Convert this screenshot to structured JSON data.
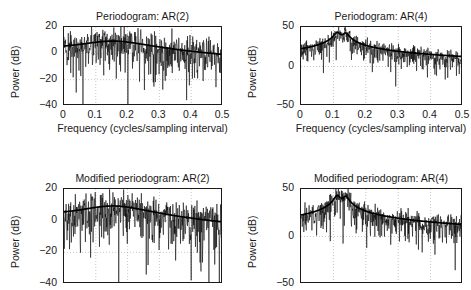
{
  "figure": {
    "background": "#ffffff",
    "ink": "#1a1a1a",
    "grid_color": "#9a9a9a",
    "data_color": "#000000",
    "smooth_color": "#000000"
  },
  "chart_data": [
    {
      "id": "periodogram-ar2",
      "type": "line",
      "title": "Periodogram: AR(2)",
      "xlabel": "Frequency (cycles/sampling interval)",
      "ylabel": "Power (dB)",
      "xlim": [
        0,
        0.5
      ],
      "ylim": [
        -40,
        20
      ],
      "xticks": [
        0,
        0.1,
        0.2,
        0.3,
        0.4,
        0.5
      ],
      "xticklabels": [
        "0",
        "0.1",
        "0.2",
        "0.3",
        "0.4",
        "0.5"
      ],
      "yticks": [
        -40,
        -20,
        0,
        20
      ],
      "yticklabels": [
        "-40",
        "-20",
        "0",
        "20"
      ],
      "grid": true,
      "show_xticklabels": true,
      "show_xlabel": true,
      "noise_db": 9.5,
      "seed": 1207,
      "series": [
        {
          "name": "periodogram estimate",
          "kind": "noisy-spectrum",
          "color": "#000000"
        },
        {
          "name": "true AR(2) spectrum",
          "kind": "smooth-spectrum",
          "color": "#000000",
          "peaks": [
            {
              "f0": 0.155,
              "gain": 9.0,
              "width": 0.105
            }
          ],
          "floor_db": -8.5,
          "base_db": 0.5,
          "tilt_db": -8.5
        }
      ]
    },
    {
      "id": "periodogram-ar4",
      "type": "line",
      "title": "Periodogram: AR(4)",
      "xlabel": "Frequency (cycles/sampling interval)",
      "ylabel": "Power (dB)",
      "xlim": [
        0,
        0.5
      ],
      "ylim": [
        -50,
        50
      ],
      "xticks": [
        0,
        0.1,
        0.2,
        0.3,
        0.4,
        0.5
      ],
      "xticklabels": [
        "0",
        "0.1",
        "0.2",
        "0.3",
        "0.4",
        "0.5"
      ],
      "yticks": [
        -50,
        0,
        50
      ],
      "yticklabels": [
        "-50",
        "0",
        "50"
      ],
      "grid": true,
      "show_xticklabels": true,
      "show_xlabel": true,
      "noise_db": 8.0,
      "noise_floor_db": -7.0,
      "seed": 4411,
      "series": [
        {
          "name": "periodogram estimate",
          "kind": "noisy-spectrum-floor",
          "color": "#000000"
        },
        {
          "name": "true AR(4) spectrum",
          "kind": "smooth-spectrum",
          "color": "#000000",
          "peaks": [
            {
              "f0": 0.112,
              "gain": 43.0,
              "width": 0.0085
            },
            {
              "f0": 0.138,
              "gain": 42.0,
              "width": 0.0085
            }
          ],
          "floor_db": -22.0,
          "base_db": 9.0,
          "tilt_db": -31.0
        }
      ]
    },
    {
      "id": "modified-periodogram-ar2",
      "type": "line",
      "title": "Modified periodogram: AR(2)",
      "xlabel": "Frequency (cycles/sampling interval)",
      "ylabel": "Power (dB)",
      "xlim": [
        0,
        0.5
      ],
      "ylim": [
        -40,
        20
      ],
      "xticks": [
        0,
        0.1,
        0.2,
        0.3,
        0.4,
        0.5
      ],
      "xticklabels": [
        "0",
        "0.1",
        "0.2",
        "0.3",
        "0.4",
        "0.5"
      ],
      "yticks": [
        -40,
        -20,
        0,
        20
      ],
      "yticklabels": [
        "-40",
        "-20",
        "0",
        "20"
      ],
      "grid": true,
      "show_xticklabels": false,
      "show_xlabel": false,
      "noise_db": 9.0,
      "seed": 8822,
      "series": [
        {
          "name": "modified periodogram estimate",
          "kind": "noisy-spectrum",
          "color": "#000000"
        },
        {
          "name": "true AR(2) spectrum",
          "kind": "smooth-spectrum",
          "color": "#000000",
          "peaks": [
            {
              "f0": 0.155,
              "gain": 9.0,
              "width": 0.105
            }
          ],
          "floor_db": -8.5,
          "base_db": 0.5,
          "tilt_db": -8.5
        }
      ]
    },
    {
      "id": "modified-periodogram-ar4",
      "type": "line",
      "title": "Modified periodogram: AR(4)",
      "xlabel": "Frequency (cycles/sampling interval)",
      "ylabel": "Power (dB)",
      "xlim": [
        0,
        0.5
      ],
      "ylim": [
        -50,
        50
      ],
      "xticks": [
        0,
        0.1,
        0.2,
        0.3,
        0.4,
        0.5
      ],
      "xticklabels": [
        "0",
        "0.1",
        "0.2",
        "0.3",
        "0.4",
        "0.5"
      ],
      "yticks": [
        -50,
        0,
        50
      ],
      "yticklabels": [
        "-50",
        "0",
        "50"
      ],
      "grid": true,
      "show_xticklabels": false,
      "show_xlabel": false,
      "noise_db": 8.5,
      "seed": 9163,
      "series": [
        {
          "name": "modified periodogram estimate",
          "kind": "noisy-spectrum",
          "color": "#000000"
        },
        {
          "name": "true AR(4) spectrum",
          "kind": "smooth-spectrum",
          "color": "#000000",
          "peaks": [
            {
              "f0": 0.112,
              "gain": 43.0,
              "width": 0.0085
            },
            {
              "f0": 0.138,
              "gain": 42.0,
              "width": 0.0085
            }
          ],
          "floor_db": -22.0,
          "base_db": 9.0,
          "tilt_db": -31.0
        }
      ]
    }
  ],
  "layout": {
    "panels": [
      {
        "chart": 0,
        "left": 63,
        "top": 26,
        "width": 159,
        "height": 79
      },
      {
        "chart": 1,
        "left": 300,
        "top": 26,
        "width": 162,
        "height": 79
      },
      {
        "chart": 2,
        "left": 63,
        "top": 188,
        "width": 159,
        "height": 95
      },
      {
        "chart": 3,
        "left": 300,
        "top": 188,
        "width": 162,
        "height": 95
      }
    ]
  }
}
